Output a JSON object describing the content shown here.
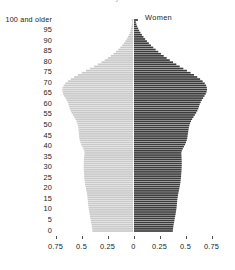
{
  "figure": {
    "title_sliver": "y",
    "background": "#ffffff"
  },
  "legend": {
    "left_label": "Men",
    "right_label": "Women",
    "left_color": "#c9c9c9",
    "right_color": "#3b3b3b"
  },
  "axes": {
    "y_top_label": "100 and older",
    "y_ticks": [
      "100 and older",
      "95",
      "90",
      "85",
      "80",
      "75",
      "70",
      "65",
      "60",
      "55",
      "50",
      "45",
      "40",
      "35",
      "30",
      "25",
      "20",
      "15",
      "10",
      "5",
      "0"
    ],
    "x_ticks": [
      "0.75",
      "0.5",
      "0.25",
      "0",
      "0.25",
      "0.5",
      "0.75"
    ],
    "x_tick_values": [
      -0.75,
      -0.5,
      -0.25,
      0,
      0.25,
      0.5,
      0.75
    ],
    "x_min": -0.875,
    "x_max": 0.875
  },
  "chart_data": {
    "type": "bar",
    "orientation": "horizontal-diverging",
    "title": "",
    "subtitle": "",
    "xlabel": "",
    "ylabel": "",
    "xlim": [
      -0.875,
      0.875
    ],
    "grid": false,
    "legend_position": "top-center",
    "categories": [
      0,
      1,
      2,
      3,
      4,
      5,
      6,
      7,
      8,
      9,
      10,
      11,
      12,
      13,
      14,
      15,
      16,
      17,
      18,
      19,
      20,
      21,
      22,
      23,
      24,
      25,
      26,
      27,
      28,
      29,
      30,
      31,
      32,
      33,
      34,
      35,
      36,
      37,
      38,
      39,
      40,
      41,
      42,
      43,
      44,
      45,
      46,
      47,
      48,
      49,
      50,
      51,
      52,
      53,
      54,
      55,
      56,
      57,
      58,
      59,
      60,
      61,
      62,
      63,
      64,
      65,
      66,
      67,
      68,
      69,
      70,
      71,
      72,
      73,
      74,
      75,
      76,
      77,
      78,
      79,
      80,
      81,
      82,
      83,
      84,
      85,
      86,
      87,
      88,
      89,
      90,
      91,
      92,
      93,
      94,
      95,
      96,
      97,
      98,
      99,
      100
    ],
    "category_label": "Age",
    "value_unit": "millions",
    "series": [
      {
        "name": "Men",
        "color": "#c9c9c9",
        "side": "left",
        "values": [
          0.39,
          0.392,
          0.395,
          0.398,
          0.402,
          0.406,
          0.41,
          0.414,
          0.418,
          0.421,
          0.424,
          0.427,
          0.43,
          0.432,
          0.434,
          0.436,
          0.438,
          0.441,
          0.444,
          0.448,
          0.452,
          0.456,
          0.46,
          0.463,
          0.466,
          0.468,
          0.47,
          0.471,
          0.472,
          0.473,
          0.474,
          0.474,
          0.474,
          0.473,
          0.472,
          0.47,
          0.468,
          0.466,
          0.47,
          0.478,
          0.488,
          0.498,
          0.506,
          0.512,
          0.516,
          0.518,
          0.52,
          0.522,
          0.524,
          0.526,
          0.53,
          0.536,
          0.544,
          0.554,
          0.566,
          0.578,
          0.59,
          0.6,
          0.608,
          0.614,
          0.62,
          0.628,
          0.638,
          0.65,
          0.662,
          0.672,
          0.678,
          0.68,
          0.676,
          0.666,
          0.65,
          0.626,
          0.598,
          0.566,
          0.53,
          0.492,
          0.452,
          0.412,
          0.374,
          0.338,
          0.304,
          0.272,
          0.242,
          0.214,
          0.188,
          0.164,
          0.142,
          0.122,
          0.104,
          0.088,
          0.073,
          0.06,
          0.049,
          0.039,
          0.031,
          0.024,
          0.018,
          0.014,
          0.01,
          0.007,
          0.014
        ]
      },
      {
        "name": "Women",
        "color": "#3b3b3b",
        "side": "right",
        "values": [
          0.373,
          0.375,
          0.378,
          0.381,
          0.385,
          0.389,
          0.392,
          0.396,
          0.4,
          0.403,
          0.406,
          0.409,
          0.411,
          0.413,
          0.415,
          0.417,
          0.42,
          0.423,
          0.427,
          0.431,
          0.435,
          0.439,
          0.443,
          0.446,
          0.449,
          0.451,
          0.453,
          0.454,
          0.456,
          0.457,
          0.458,
          0.459,
          0.459,
          0.459,
          0.458,
          0.457,
          0.456,
          0.455,
          0.46,
          0.469,
          0.48,
          0.491,
          0.5,
          0.507,
          0.512,
          0.515,
          0.518,
          0.521,
          0.524,
          0.527,
          0.532,
          0.539,
          0.548,
          0.559,
          0.572,
          0.585,
          0.598,
          0.609,
          0.618,
          0.625,
          0.632,
          0.641,
          0.652,
          0.665,
          0.678,
          0.69,
          0.698,
          0.702,
          0.7,
          0.693,
          0.68,
          0.66,
          0.636,
          0.608,
          0.577,
          0.544,
          0.509,
          0.474,
          0.44,
          0.407,
          0.375,
          0.344,
          0.314,
          0.286,
          0.259,
          0.233,
          0.208,
          0.185,
          0.163,
          0.143,
          0.124,
          0.107,
          0.091,
          0.076,
          0.062,
          0.05,
          0.04,
          0.031,
          0.023,
          0.017,
          0.038
        ]
      }
    ]
  }
}
